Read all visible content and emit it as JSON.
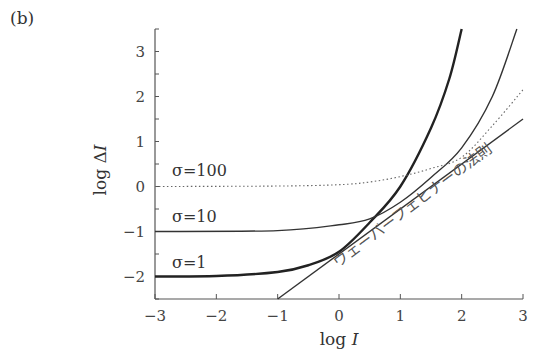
{
  "panel_label": "(b)",
  "chart_data": {
    "type": "line",
    "title": "",
    "xlabel": "log I",
    "ylabel": "log ΔI",
    "xlim": [
      -3,
      3
    ],
    "ylim": [
      -2.5,
      3.5
    ],
    "xticks": [
      -3,
      -2,
      -1,
      0,
      1,
      2,
      3
    ],
    "yticks": [
      -2,
      -1,
      0,
      1,
      2,
      3
    ],
    "grid": false,
    "legend": "inline labels",
    "series": [
      {
        "name": "σ=1",
        "style": "thick-solid",
        "x": [
          -3,
          -2,
          -1,
          -0.5,
          0,
          0.5,
          1,
          1.5,
          1.8,
          2.0
        ],
        "y": [
          -2,
          -1.99,
          -1.9,
          -1.75,
          -1.45,
          -0.8,
          0.0,
          1.3,
          2.4,
          3.5
        ]
      },
      {
        "name": "σ=10",
        "style": "solid",
        "x": [
          -3,
          -1,
          0,
          0.5,
          1,
          1.5,
          2,
          2.5,
          2.9
        ],
        "y": [
          -1,
          -0.98,
          -0.85,
          -0.72,
          -0.35,
          0.2,
          0.86,
          2.0,
          3.5
        ]
      },
      {
        "name": "σ=100",
        "style": "dotted",
        "x": [
          -3,
          -1,
          0,
          0.5,
          1,
          1.5,
          2,
          2.5,
          3
        ],
        "y": [
          0,
          0.01,
          0.04,
          0.1,
          0.22,
          0.4,
          0.65,
          1.35,
          2.15
        ]
      },
      {
        "name": "ウェーバーフェヒナーの法則",
        "style": "solid-line",
        "x": [
          -1.0,
          3.0
        ],
        "y": [
          -2.5,
          1.5
        ]
      }
    ],
    "annotations": [
      "σ=100",
      "σ=10",
      "σ=1",
      "ウェーバーフェヒナーの法則"
    ]
  },
  "labels": {
    "sigma100": "σ=100",
    "sigma10": "σ=10",
    "sigma1": "σ=1",
    "weber": "ウェーバーフェヒナーの法則",
    "xlabel": "log I",
    "ylabel": "log ΔI"
  }
}
